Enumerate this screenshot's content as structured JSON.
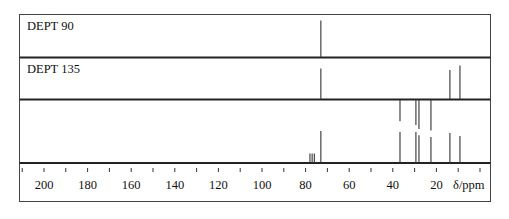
{
  "chart_data": {
    "type": "stacked-stick-spectrum",
    "xlabel": "δ/ppm",
    "x_axis": {
      "reversed": true,
      "range": [
        210,
        -4
      ],
      "major_ticks": [
        200,
        180,
        160,
        140,
        120,
        100,
        80,
        60,
        40,
        20
      ],
      "minor_ticks": [
        210,
        190,
        170,
        150,
        130,
        110,
        90,
        70,
        50,
        30,
        10,
        0
      ],
      "tick_labels": [
        "200",
        "180",
        "160",
        "140",
        "120",
        "100",
        "80",
        "60",
        "40",
        "20"
      ],
      "unit_label": "δ/ppm"
    },
    "panels": [
      {
        "name": "DEPT 90",
        "label": "DEPT 90",
        "peaks": [
          {
            "ppm": 73.0,
            "intensity": 1.0,
            "multiplicity": "CH"
          }
        ]
      },
      {
        "name": "DEPT 135",
        "label": "DEPT 135",
        "peaks": [
          {
            "ppm": 73.0,
            "intensity": 1.0,
            "multiplicity": "CH"
          },
          {
            "ppm": 36.7,
            "intensity": -0.7,
            "multiplicity": "CH2"
          },
          {
            "ppm": 29.4,
            "intensity": -0.82,
            "multiplicity": "CH2"
          },
          {
            "ppm": 28.0,
            "intensity": -0.95,
            "multiplicity": "CH2"
          },
          {
            "ppm": 22.5,
            "intensity": -1.0,
            "multiplicity": "CH2"
          },
          {
            "ppm": 13.8,
            "intensity": 0.95,
            "multiplicity": "CH3"
          },
          {
            "ppm": 9.2,
            "intensity": 1.1,
            "multiplicity": "CH3"
          }
        ]
      },
      {
        "name": "13C broadband",
        "label": "",
        "peaks": [
          {
            "ppm": 78.0,
            "intensity": 0.3,
            "note": "CDCl3 solvent"
          },
          {
            "ppm": 77.0,
            "intensity": 0.3,
            "note": "CDCl3 solvent"
          },
          {
            "ppm": 76.0,
            "intensity": 0.3,
            "note": "CDCl3 solvent"
          },
          {
            "ppm": 73.0,
            "intensity": 1.0
          },
          {
            "ppm": 36.7,
            "intensity": 0.97
          },
          {
            "ppm": 29.4,
            "intensity": 0.97
          },
          {
            "ppm": 28.0,
            "intensity": 0.87
          },
          {
            "ppm": 22.5,
            "intensity": 0.81
          },
          {
            "ppm": 13.8,
            "intensity": 0.94
          },
          {
            "ppm": 9.2,
            "intensity": 0.84
          }
        ]
      }
    ],
    "legend": null,
    "grid": false
  },
  "labels": {
    "dept90": "DEPT 90",
    "dept135": "DEPT 135",
    "unit": "δ/ppm"
  }
}
